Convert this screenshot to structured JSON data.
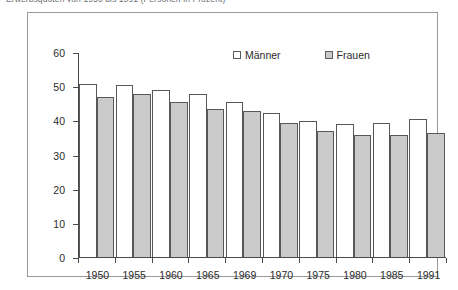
{
  "caption": {
    "text": "Erwerbsquoten von 1950 bis 1991 (Personen in Prozent)"
  },
  "legend": {
    "position": "top-center",
    "items": [
      {
        "label": "Männer",
        "swatch": "white-square-icon",
        "color": "#ffffff"
      },
      {
        "label": "Frauen",
        "swatch": "gray-square-icon",
        "color": "#cbcbcb"
      }
    ]
  },
  "axes": {
    "y_ticks": [
      "60",
      "50",
      "40",
      "30",
      "20",
      "10",
      "0"
    ],
    "x_ticks": [
      "1950",
      "1955",
      "1960",
      "1965",
      "1969",
      "1970",
      "1975",
      "1980",
      "1985",
      "1991"
    ]
  },
  "chart_data": {
    "type": "bar",
    "title": "",
    "xlabel": "",
    "ylabel": "",
    "ylim": [
      0,
      60
    ],
    "ytick_step": 10,
    "grid": false,
    "legend_position": "top-center",
    "categories": [
      "1950",
      "1955",
      "1960",
      "1965",
      "1969",
      "1970",
      "1975",
      "1980",
      "1985",
      "1991"
    ],
    "series": [
      {
        "name": "Männer",
        "color": "#ffffff",
        "values": [
          51.0,
          50.5,
          49.0,
          48.0,
          45.5,
          42.5,
          40.0,
          39.0,
          39.5,
          40.5
        ]
      },
      {
        "name": "Frauen",
        "color": "#cbcbcb",
        "values": [
          47.0,
          48.0,
          45.5,
          43.5,
          43.0,
          39.5,
          37.0,
          36.0,
          36.0,
          36.5
        ]
      }
    ]
  }
}
